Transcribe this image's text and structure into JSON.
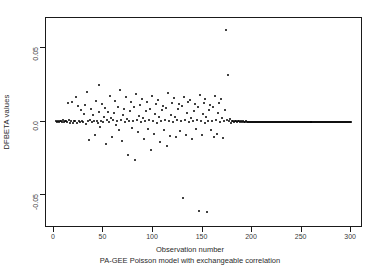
{
  "figure": {
    "top_title_clipped": "DFBETA for Observation Number",
    "background_color": "#ffffff",
    "point_color": "#000000",
    "axis_color": "#1a1a1a"
  },
  "chart_data": {
    "type": "scatter",
    "title": "",
    "xlabel": "Observation number",
    "subcaption": "PA-GEE Poisson model with exchangeable correlation",
    "ylabel": "DFBETA values",
    "xlim": [
      -8,
      312
    ],
    "ylim": [
      -0.072,
      0.07
    ],
    "grid": false,
    "legend": null,
    "xticks": [
      0,
      50,
      100,
      150,
      200,
      250,
      300
    ],
    "xtick_labels": [
      "0",
      "50",
      "100",
      "150",
      "200",
      "250",
      "300"
    ],
    "yticks": [
      0.05,
      0.0,
      -0.05
    ],
    "ytick_labels": [
      "0.05",
      "0.0",
      "-0.05"
    ],
    "marker": "filled-circle",
    "marker_size_px": 2,
    "points": [
      [
        2,
        0.0005
      ],
      [
        3,
        -0.0004
      ],
      [
        4,
        0.0006
      ],
      [
        5,
        -0.0006
      ],
      [
        6,
        0.0004
      ],
      [
        7,
        0.0002
      ],
      [
        8,
        -0.0003
      ],
      [
        9,
        0.0007
      ],
      [
        10,
        -0.0002
      ],
      [
        11,
        0.0005
      ],
      [
        12,
        0.0003
      ],
      [
        13,
        -0.0005
      ],
      [
        14,
        0.0124
      ],
      [
        15,
        0.0008
      ],
      [
        16,
        -0.0009
      ],
      [
        17,
        0.0004
      ],
      [
        18,
        0.0135
      ],
      [
        19,
        -0.0012
      ],
      [
        20,
        0.0006
      ],
      [
        21,
        0.0002
      ],
      [
        22,
        0.0165
      ],
      [
        23,
        -0.0008
      ],
      [
        24,
        0.0105
      ],
      [
        25,
        0.0003
      ],
      [
        26,
        -0.0004
      ],
      [
        27,
        0.0075
      ],
      [
        28,
        0.0002
      ],
      [
        29,
        -0.0006
      ],
      [
        30,
        0.0048
      ],
      [
        31,
        0.0113
      ],
      [
        32,
        -0.0018
      ],
      [
        33,
        0.0201
      ],
      [
        34,
        0.0006
      ],
      [
        35,
        -0.0125
      ],
      [
        36,
        0.0008
      ],
      [
        37,
        0.0086
      ],
      [
        38,
        -0.0004
      ],
      [
        39,
        0.0042
      ],
      [
        40,
        0.0002
      ],
      [
        41,
        -0.0092
      ],
      [
        42,
        0.0137
      ],
      [
        43,
        0.0005
      ],
      [
        44,
        -0.0007
      ],
      [
        45,
        0.0062
      ],
      [
        46,
        0.0248
      ],
      [
        47,
        -0.0035
      ],
      [
        48,
        0.0004
      ],
      [
        49,
        0.0118
      ],
      [
        50,
        -0.0006
      ],
      [
        51,
        0.0031
      ],
      [
        52,
        0.0089
      ],
      [
        53,
        -0.0151
      ],
      [
        54,
        0.0007
      ],
      [
        55,
        0.0065
      ],
      [
        56,
        -0.0004
      ],
      [
        57,
        0.0172
      ],
      [
        58,
        0.0026
      ],
      [
        59,
        -0.0102
      ],
      [
        60,
        0.0009
      ],
      [
        61,
        0.0055
      ],
      [
        62,
        0.0142
      ],
      [
        63,
        -0.0021
      ],
      [
        64,
        0.0003
      ],
      [
        65,
        0.0098
      ],
      [
        66,
        -0.0058
      ],
      [
        67,
        0.0215
      ],
      [
        68,
        0.0007
      ],
      [
        69,
        -0.0131
      ],
      [
        70,
        0.0044
      ],
      [
        71,
        0.0082
      ],
      [
        72,
        -0.0005
      ],
      [
        73,
        0.0163
      ],
      [
        74,
        0.0019
      ],
      [
        75,
        -0.0225
      ],
      [
        76,
        0.0006
      ],
      [
        77,
        0.0071
      ],
      [
        78,
        0.0129
      ],
      [
        79,
        -0.0041
      ],
      [
        80,
        0.0003
      ],
      [
        81,
        0.0095
      ],
      [
        82,
        -0.0262
      ],
      [
        83,
        0.0186
      ],
      [
        84,
        0.0008
      ],
      [
        85,
        -0.0073
      ],
      [
        86,
        0.0038
      ],
      [
        87,
        0.0112
      ],
      [
        88,
        -0.0006
      ],
      [
        89,
        0.0152
      ],
      [
        90,
        0.0023
      ],
      [
        91,
        -0.0118
      ],
      [
        92,
        0.0004
      ],
      [
        93,
        0.0068
      ],
      [
        94,
        0.0135
      ],
      [
        95,
        -0.0049
      ],
      [
        96,
        0.0009
      ],
      [
        97,
        0.0088
      ],
      [
        98,
        -0.0195
      ],
      [
        99,
        0.0174
      ],
      [
        100,
        0.0005
      ],
      [
        101,
        -0.0086
      ],
      [
        102,
        0.0052
      ],
      [
        103,
        0.0121
      ],
      [
        104,
        -0.0007
      ],
      [
        105,
        0.0148
      ],
      [
        106,
        0.0029
      ],
      [
        107,
        -0.0138
      ],
      [
        108,
        0.0004
      ],
      [
        109,
        0.0078
      ],
      [
        110,
        0.0108
      ],
      [
        111,
        -0.0056
      ],
      [
        112,
        0.0008
      ],
      [
        113,
        0.0092
      ],
      [
        114,
        -0.0165
      ],
      [
        115,
        0.0192
      ],
      [
        116,
        0.0006
      ],
      [
        117,
        -0.0098
      ],
      [
        118,
        0.0046
      ],
      [
        119,
        0.0126
      ],
      [
        120,
        -0.0004
      ],
      [
        121,
        0.0158
      ],
      [
        122,
        0.0033
      ],
      [
        123,
        -0.0108
      ],
      [
        124,
        0.0007
      ],
      [
        125,
        0.0084
      ],
      [
        126,
        0.0116
      ],
      [
        127,
        -0.0062
      ],
      [
        128,
        0.0005
      ],
      [
        129,
        0.0102
      ],
      [
        130,
        -0.0515
      ],
      [
        131,
        0.0168
      ],
      [
        132,
        0.0009
      ],
      [
        133,
        -0.0088
      ],
      [
        134,
        0.0058
      ],
      [
        135,
        0.0131
      ],
      [
        136,
        -0.0006
      ],
      [
        137,
        0.0145
      ],
      [
        138,
        0.0027
      ],
      [
        139,
        -0.0118
      ],
      [
        140,
        0.0003
      ],
      [
        141,
        0.0072
      ],
      [
        142,
        0.0119
      ],
      [
        143,
        -0.0052
      ],
      [
        144,
        0.0008
      ],
      [
        145,
        0.0096
      ],
      [
        146,
        -0.0605
      ],
      [
        147,
        0.0182
      ],
      [
        148,
        0.0004
      ],
      [
        149,
        -0.0092
      ],
      [
        150,
        0.0049
      ],
      [
        151,
        0.0124
      ],
      [
        152,
        -0.0007
      ],
      [
        153,
        0.0152
      ],
      [
        154,
        0.0031
      ],
      [
        155,
        -0.0615
      ],
      [
        156,
        0.0006
      ],
      [
        157,
        0.0081
      ],
      [
        158,
        0.0114
      ],
      [
        159,
        -0.0058
      ],
      [
        160,
        0.0005
      ],
      [
        161,
        0.0099
      ],
      [
        162,
        -0.0102
      ],
      [
        163,
        0.0172
      ],
      [
        164,
        0.0009
      ],
      [
        165,
        -0.0085
      ],
      [
        166,
        0.0055
      ],
      [
        167,
        0.0128
      ],
      [
        168,
        -0.0005
      ],
      [
        169,
        0.0149
      ],
      [
        170,
        0.0025
      ],
      [
        171,
        -0.0112
      ],
      [
        172,
        0.0004
      ],
      [
        173,
        0.0076
      ],
      [
        174,
        0.0622
      ],
      [
        175,
        0.0008
      ],
      [
        176,
        0.0312
      ],
      [
        177,
        0.0002
      ],
      [
        178,
        0.0014
      ],
      [
        179,
        -0.0012
      ],
      [
        180,
        0.0006
      ],
      [
        181,
        0.0003
      ],
      [
        182,
        -0.0002
      ],
      [
        183,
        0.0004
      ],
      [
        184,
        0.0001
      ],
      [
        185,
        -0.0003
      ],
      [
        186,
        0.0002
      ],
      [
        187,
        0.0001
      ],
      [
        188,
        -0.0001
      ],
      [
        189,
        0.0002
      ],
      [
        190,
        0.0
      ],
      [
        191,
        0.0001
      ],
      [
        192,
        -0.0001
      ],
      [
        193,
        0.0
      ],
      [
        194,
        0.0001
      ],
      [
        195,
        0.0
      ],
      [
        196,
        0.0
      ],
      [
        197,
        0.0
      ],
      [
        198,
        0.0
      ],
      [
        199,
        0.0
      ],
      [
        200,
        0.0
      ],
      [
        201,
        0.0
      ],
      [
        202,
        0.0
      ],
      [
        203,
        0.0
      ],
      [
        204,
        0.0
      ],
      [
        205,
        0.0
      ],
      [
        206,
        0.0
      ],
      [
        207,
        0.0
      ],
      [
        208,
        0.0
      ],
      [
        209,
        0.0
      ],
      [
        210,
        0.0
      ],
      [
        211,
        0.0
      ],
      [
        212,
        0.0
      ],
      [
        213,
        0.0
      ],
      [
        214,
        0.0
      ],
      [
        215,
        0.0
      ],
      [
        216,
        0.0
      ],
      [
        217,
        0.0
      ],
      [
        218,
        0.0
      ],
      [
        219,
        0.0
      ],
      [
        220,
        0.0
      ],
      [
        221,
        0.0
      ],
      [
        222,
        0.0
      ],
      [
        223,
        0.0
      ],
      [
        224,
        0.0
      ],
      [
        225,
        0.0
      ],
      [
        226,
        0.0
      ],
      [
        227,
        0.0
      ],
      [
        228,
        0.0
      ],
      [
        229,
        0.0
      ],
      [
        230,
        0.0
      ],
      [
        231,
        0.0
      ],
      [
        232,
        0.0
      ],
      [
        233,
        0.0
      ],
      [
        234,
        0.0
      ],
      [
        235,
        0.0
      ],
      [
        236,
        0.0
      ],
      [
        237,
        0.0
      ],
      [
        238,
        0.0
      ],
      [
        239,
        0.0
      ],
      [
        240,
        0.0
      ],
      [
        241,
        0.0
      ],
      [
        242,
        0.0
      ],
      [
        243,
        0.0
      ],
      [
        244,
        0.0
      ],
      [
        245,
        0.0
      ],
      [
        246,
        0.0
      ],
      [
        247,
        0.0
      ],
      [
        248,
        0.0
      ],
      [
        249,
        0.0
      ],
      [
        250,
        0.0
      ],
      [
        251,
        0.0
      ],
      [
        252,
        0.0
      ],
      [
        253,
        0.0
      ],
      [
        254,
        0.0
      ],
      [
        255,
        0.0
      ],
      [
        256,
        0.0
      ],
      [
        257,
        0.0
      ],
      [
        258,
        0.0
      ],
      [
        259,
        0.0
      ],
      [
        260,
        0.0
      ],
      [
        261,
        0.0
      ],
      [
        262,
        0.0
      ],
      [
        263,
        0.0
      ],
      [
        264,
        0.0
      ],
      [
        265,
        0.0
      ],
      [
        266,
        0.0
      ],
      [
        267,
        0.0
      ],
      [
        268,
        0.0
      ],
      [
        269,
        0.0
      ],
      [
        270,
        0.0
      ],
      [
        271,
        0.0
      ],
      [
        272,
        0.0
      ],
      [
        273,
        0.0
      ],
      [
        274,
        0.0
      ],
      [
        275,
        0.0
      ],
      [
        276,
        0.0
      ],
      [
        277,
        0.0
      ],
      [
        278,
        0.0
      ],
      [
        279,
        0.0
      ],
      [
        280,
        0.0
      ],
      [
        281,
        0.0
      ],
      [
        282,
        0.0
      ],
      [
        283,
        0.0
      ],
      [
        284,
        0.0
      ],
      [
        285,
        0.0
      ],
      [
        286,
        0.0
      ],
      [
        287,
        0.0
      ],
      [
        288,
        0.0
      ],
      [
        289,
        0.0
      ],
      [
        290,
        0.0
      ],
      [
        291,
        0.0
      ],
      [
        292,
        0.0
      ],
      [
        293,
        0.0
      ],
      [
        294,
        0.0
      ],
      [
        295,
        0.0
      ],
      [
        296,
        0.0
      ],
      [
        297,
        0.0
      ],
      [
        298,
        0.0
      ],
      [
        299,
        0.0
      ],
      [
        300,
        0.0
      ]
    ]
  }
}
